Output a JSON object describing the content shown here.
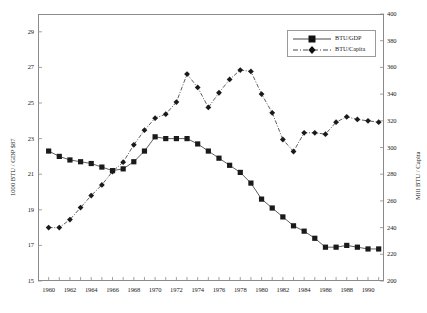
{
  "chart_data": {
    "type": "line",
    "title": "",
    "subtitle": "",
    "xlabel": "",
    "ylabel": "1000 BTU / GDP $87",
    "y2label": "Mill BTU / Capita",
    "grid": false,
    "legend_position": "top-right",
    "xlim": [
      1959,
      1991.5
    ],
    "ylim": [
      15,
      30
    ],
    "y2lim": [
      200,
      400
    ],
    "xticks": [
      1960,
      1961,
      1962,
      1963,
      1964,
      1965,
      1966,
      1967,
      1968,
      1969,
      1970,
      1971,
      1972,
      1973,
      1974,
      1975,
      1976,
      1977,
      1978,
      1979,
      1980,
      1981,
      1982,
      1983,
      1984,
      1985,
      1986,
      1987,
      1988,
      1989,
      1990,
      1991
    ],
    "xticklabels": [
      "1960",
      "",
      "1962",
      "",
      "1964",
      "",
      "1966",
      "",
      "1968",
      "",
      "1970",
      "",
      "1972",
      "",
      "1974",
      "",
      "1976",
      "",
      "1978",
      "",
      "1980",
      "",
      "1982",
      "",
      "1984",
      "",
      "1986",
      "",
      "1988",
      "",
      "1990",
      ""
    ],
    "yticks": [
      15,
      17,
      19,
      21,
      23,
      25,
      27,
      29
    ],
    "yticklabels": [
      "15",
      "17",
      "19",
      "21",
      "23",
      "25",
      "27",
      "29"
    ],
    "y2ticks": [
      200,
      220,
      240,
      260,
      280,
      300,
      320,
      340,
      360,
      380,
      400
    ],
    "y2ticklabels": [
      "200",
      "220",
      "240",
      "260",
      "280",
      "300",
      "320",
      "340",
      "360",
      "380",
      "400"
    ],
    "x": [
      1960,
      1961,
      1962,
      1963,
      1964,
      1965,
      1966,
      1967,
      1968,
      1969,
      1970,
      1971,
      1972,
      1973,
      1974,
      1975,
      1976,
      1977,
      1978,
      1979,
      1980,
      1981,
      1982,
      1983,
      1984,
      1985,
      1986,
      1987,
      1988,
      1989,
      1990,
      1991
    ],
    "series": [
      {
        "name": "BTU/GDP",
        "axis": "left",
        "marker": "square",
        "line_style": "solid",
        "color": "#1a1a1a",
        "values": [
          22.3,
          22.0,
          21.8,
          21.7,
          21.6,
          21.4,
          21.2,
          21.3,
          21.7,
          22.3,
          23.1,
          23.0,
          23.0,
          23.0,
          22.7,
          22.3,
          21.9,
          21.5,
          21.1,
          20.5,
          19.6,
          19.1,
          18.6,
          18.1,
          17.8,
          17.4,
          16.9,
          16.9,
          17.0,
          16.9,
          16.8,
          16.8
        ]
      },
      {
        "name": "BTU/Capita",
        "axis": "right",
        "marker": "diamond",
        "line_style": "dash-dot",
        "color": "#1a1a1a",
        "values": [
          240,
          240,
          246,
          255,
          264,
          272,
          282,
          289,
          302,
          313,
          322,
          325,
          334,
          355,
          345,
          330,
          341,
          351,
          358,
          357,
          340,
          326,
          306,
          297,
          311,
          311,
          310,
          319,
          323,
          321,
          320,
          319
        ]
      }
    ]
  },
  "axes": {
    "left_title": "1000 BTU / GDP $87",
    "right_title": "Mill BTU / Capita"
  },
  "legend": {
    "items": [
      {
        "label": "BTU/GDP"
      },
      {
        "label": "BTU/Capita"
      }
    ]
  }
}
